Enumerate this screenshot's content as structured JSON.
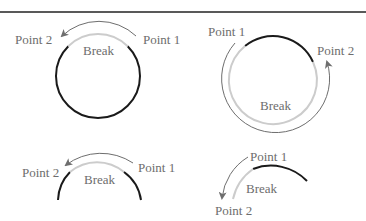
{
  "colors": {
    "rule": "#222222",
    "intact_strand": "#1a1a1a",
    "break_strand": "#cccccc",
    "arrow": "#6e6e6e",
    "label": "#6d6d6d"
  },
  "panels": [
    {
      "id": "top-left",
      "shape": "full-circle",
      "labels": {
        "point1": "Point 1",
        "point2": "Point 2",
        "break": "Break"
      },
      "arrow_direction": "point1-to-point2 counterclockwise (short path over top)"
    },
    {
      "id": "top-right",
      "shape": "full-circle",
      "labels": {
        "point1": "Point 1",
        "point2": "Point 2",
        "break": "Break"
      },
      "arrow_direction": "point1-to-point2 counterclockwise (long path around bottom)"
    },
    {
      "id": "bottom-left",
      "shape": "arc",
      "labels": {
        "point1": "Point 1",
        "point2": "Point 2",
        "break": "Break"
      },
      "arrow_direction": "point1-to-point2 counterclockwise (over top)"
    },
    {
      "id": "bottom-right",
      "shape": "arc",
      "labels": {
        "point1": "Point 1",
        "point2": "Point 2",
        "break": "Break"
      },
      "arrow_direction": "point1-to-point2 counterclockwise (down left side)"
    }
  ]
}
